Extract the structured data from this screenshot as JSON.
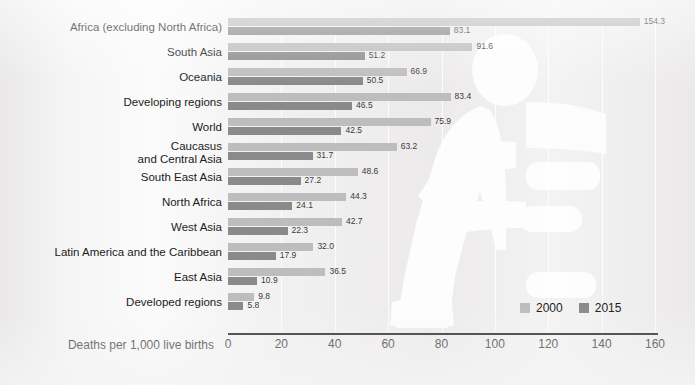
{
  "chart_data": {
    "type": "bar",
    "orientation": "horizontal",
    "title": "",
    "xlabel": "Deaths per 1,000 live births",
    "ylabel": "",
    "xlim": [
      0,
      160
    ],
    "xticks": [
      0,
      20,
      40,
      60,
      80,
      100,
      120,
      140,
      160
    ],
    "grid": true,
    "legend_position": "bottom-right",
    "categories": [
      "Africa (excluding North Africa)",
      "South Asia",
      "Oceania",
      "Developing regions",
      "World",
      "Caucasus and Central Asia",
      "South East Asia",
      "North Africa",
      "West Asia",
      "Latin America and the Caribbean",
      "East Asia",
      "Developed regions"
    ],
    "category_lines": [
      [
        "Africa (excluding North Africa)"
      ],
      [
        "South Asia"
      ],
      [
        "Oceania"
      ],
      [
        "Developing regions"
      ],
      [
        "World"
      ],
      [
        "Caucasus",
        "and Central Asia"
      ],
      [
        "South East Asia"
      ],
      [
        "North Africa"
      ],
      [
        "West Asia"
      ],
      [
        "Latin America and the Caribbean"
      ],
      [
        "East Asia"
      ],
      [
        "Developed regions"
      ]
    ],
    "series": [
      {
        "name": "2000",
        "color": "#bdbdbd",
        "values": [
          154.3,
          91.6,
          66.9,
          83.4,
          75.9,
          63.2,
          48.6,
          44.3,
          42.7,
          32.0,
          36.5,
          9.8
        ],
        "labels": [
          "154.3",
          "91.6",
          "66.9",
          "83.4",
          "75.9",
          "63.2",
          "48.6",
          "44.3",
          "42.7",
          "32.0",
          "36.5",
          "9.8"
        ]
      },
      {
        "name": "2015",
        "color": "#8a8a8a",
        "values": [
          83.1,
          51.2,
          50.5,
          46.5,
          42.5,
          31.7,
          27.2,
          24.1,
          22.3,
          17.9,
          10.9,
          5.8
        ],
        "labels": [
          "83.1",
          "51.2",
          "50.5",
          "46.5",
          "42.5",
          "31.7",
          "27.2",
          "24.1",
          "22.3",
          "17.9",
          "10.9",
          "5.8"
        ]
      }
    ]
  },
  "legend": {
    "items": [
      {
        "label": "2000",
        "color": "#bdbdbd"
      },
      {
        "label": "2015",
        "color": "#8a8a8a"
      }
    ]
  },
  "axis": {
    "title": "Deaths per 1,000 live births",
    "tick_labels": [
      "0",
      "20",
      "40",
      "60",
      "80",
      "100",
      "120",
      "140",
      "160"
    ]
  },
  "watermark": {
    "name": "adult-and-child-silhouette",
    "color": "#ffffff"
  }
}
